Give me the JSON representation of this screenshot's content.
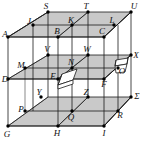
{
  "figure": {
    "type": "geometry-diagram",
    "canvas": {
      "width": 150,
      "height": 146
    },
    "colors": {
      "background": "#ffffff",
      "plane_fill": "#c9c9c9",
      "line": "#1a1a1a",
      "vertex_dot": "#000000",
      "tile_fill": "#ffffff",
      "label": "#111111"
    },
    "structure": {
      "levels": 3,
      "grid_per_level": "2x2",
      "shaded_planes": [
        "top",
        "middle",
        "bottom"
      ],
      "vertex_count": 27
    },
    "vertices": [
      {
        "id": "A",
        "label": "A",
        "x": 8,
        "y": 37,
        "lx": 5,
        "ly": 34,
        "level": "top",
        "dot": true
      },
      {
        "id": "J",
        "label": "J",
        "x": 33,
        "y": 25,
        "lx": 29,
        "ly": 21,
        "level": "top",
        "dot": true
      },
      {
        "id": "S",
        "label": "S",
        "x": 48,
        "y": 12,
        "lx": 46,
        "ly": 6,
        "level": "top",
        "dot": true
      },
      {
        "id": "B",
        "label": "B",
        "x": 58,
        "y": 37,
        "lx": 57,
        "ly": 31,
        "level": "top",
        "dot": true
      },
      {
        "id": "K",
        "label": "K",
        "x": 72,
        "y": 25,
        "lx": 71,
        "ly": 20,
        "level": "top",
        "dot": true
      },
      {
        "id": "T",
        "label": "T",
        "x": 88,
        "y": 12,
        "lx": 86,
        "ly": 6,
        "level": "top",
        "dot": true
      },
      {
        "id": "C",
        "label": "C",
        "x": 104,
        "y": 37,
        "lx": 102,
        "ly": 31,
        "level": "top",
        "dot": true
      },
      {
        "id": "L",
        "label": "L",
        "x": 114,
        "y": 25,
        "lx": 112,
        "ly": 20,
        "level": "top",
        "dot": true
      },
      {
        "id": "U",
        "label": "U",
        "x": 131,
        "y": 12,
        "lx": 134,
        "ly": 6,
        "level": "top",
        "dot": true
      },
      {
        "id": "D",
        "label": "D",
        "x": 8,
        "y": 79,
        "lx": 5,
        "ly": 79,
        "level": "middle",
        "dot": true
      },
      {
        "id": "M",
        "label": "M",
        "x": 25,
        "y": 68,
        "lx": 21,
        "ly": 65,
        "level": "middle",
        "dot": true
      },
      {
        "id": "V",
        "label": "V",
        "x": 48,
        "y": 55,
        "lx": 47,
        "ly": 49,
        "level": "middle",
        "dot": true
      },
      {
        "id": "E",
        "label": "E",
        "x": 58,
        "y": 79,
        "lx": 53,
        "ly": 76,
        "level": "middle",
        "dot": true
      },
      {
        "id": "N",
        "label": "N",
        "x": 72,
        "y": 68,
        "lx": 71,
        "ly": 62,
        "level": "middle",
        "dot": true
      },
      {
        "id": "W",
        "label": "W",
        "x": 88,
        "y": 55,
        "lx": 87,
        "ly": 49,
        "level": "middle",
        "dot": true
      },
      {
        "id": "F",
        "label": "F",
        "x": 104,
        "y": 79,
        "lx": 104,
        "ly": 84,
        "level": "middle",
        "dot": true
      },
      {
        "id": "O",
        "label": "O",
        "x": 118,
        "y": 68,
        "lx": 122,
        "ly": 71,
        "level": "middle",
        "dot": true
      },
      {
        "id": "X",
        "label": "X",
        "x": 131,
        "y": 55,
        "lx": 136,
        "ly": 55,
        "level": "middle",
        "dot": true
      },
      {
        "id": "G",
        "label": "G",
        "x": 8,
        "y": 126,
        "lx": 7,
        "ly": 134,
        "level": "bottom",
        "dot": true
      },
      {
        "id": "P",
        "label": "P",
        "x": 25,
        "y": 111,
        "lx": 21,
        "ly": 109,
        "level": "bottom",
        "dot": true
      },
      {
        "id": "Y",
        "label": "Y",
        "x": 41,
        "y": 97,
        "lx": 39,
        "ly": 92,
        "level": "bottom",
        "dot": true
      },
      {
        "id": "H",
        "label": "H",
        "x": 58,
        "y": 126,
        "lx": 57,
        "ly": 133,
        "level": "bottom",
        "dot": true
      },
      {
        "id": "Q",
        "label": "Q",
        "x": 72,
        "y": 111,
        "lx": 71,
        "ly": 117,
        "level": "bottom",
        "dot": true
      },
      {
        "id": "Z",
        "label": "Z",
        "x": 88,
        "y": 97,
        "lx": 86,
        "ly": 92,
        "level": "bottom",
        "dot": true
      },
      {
        "id": "I",
        "label": "I",
        "x": 104,
        "y": 126,
        "lx": 104,
        "ly": 133,
        "level": "bottom",
        "dot": true
      },
      {
        "id": "R",
        "label": "R",
        "x": 118,
        "y": 111,
        "lx": 120,
        "ly": 115,
        "level": "bottom",
        "dot": true
      },
      {
        "id": "Sigma",
        "label": "Σ",
        "x": 131,
        "y": 97,
        "lx": 137,
        "ly": 96,
        "level": "bottom",
        "dot": true
      }
    ],
    "inserts": [
      {
        "id": "tile-E",
        "shape": "flat-parallelogram-tile",
        "near": "E"
      },
      {
        "id": "box-O",
        "shape": "open-box",
        "near": "O"
      }
    ]
  }
}
